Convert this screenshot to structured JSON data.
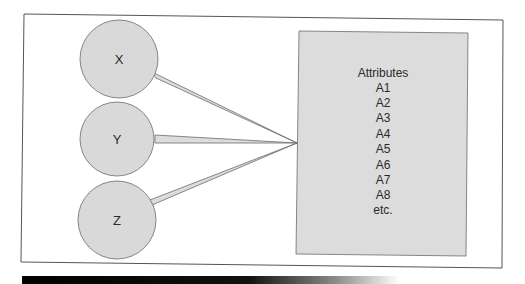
{
  "diagram": {
    "entities": [
      {
        "id": "x",
        "label": "X"
      },
      {
        "id": "y",
        "label": "Y"
      },
      {
        "id": "z",
        "label": "Z"
      }
    ],
    "attributes_box": {
      "title": "Attributes",
      "items": [
        "A1",
        "A2",
        "A3",
        "A4",
        "A5",
        "A6",
        "A7",
        "A8",
        "etc."
      ]
    },
    "colors": {
      "circle_fill": "#d9d9d9",
      "box_fill": "#dcdcdc",
      "stroke": "#6b6b6b",
      "frame": "#555555"
    }
  }
}
